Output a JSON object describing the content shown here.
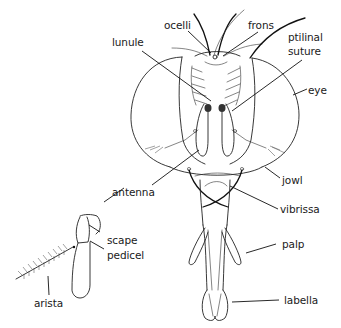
{
  "figure": {
    "labels": {
      "ocelli": "ocelli",
      "frons": "frons",
      "lunule": "lunule",
      "ptilinal_suture_line1": "ptilinal",
      "ptilinal_suture_line2": "suture",
      "eye": "eye",
      "antenna": "antenna",
      "jowl": "jowl",
      "vibrissa": "vibrissa",
      "scape": "scape",
      "pedicel": "pedicel",
      "palp": "palp",
      "arista": "arista",
      "labella": "labella"
    }
  }
}
